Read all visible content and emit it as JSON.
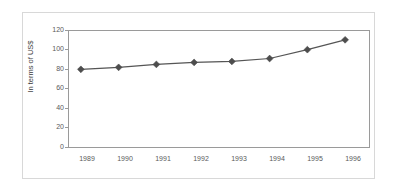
{
  "chart_data": {
    "type": "line",
    "title": "",
    "subtitle": "",
    "xlabel": "",
    "ylabel": "In terms of US$",
    "categories": [
      "1989",
      "1990",
      "1991",
      "1992",
      "1993",
      "1994",
      "1995",
      "1996"
    ],
    "values": [
      80,
      82,
      85,
      87,
      88,
      91,
      100,
      110
    ],
    "series": [
      {
        "name": "",
        "values": [
          80,
          82,
          85,
          87,
          88,
          91,
          100,
          110
        ]
      }
    ],
    "ylim": [
      0,
      120
    ],
    "yticks": [
      0,
      20,
      40,
      60,
      80,
      100,
      120
    ],
    "ytick_labels": [
      "0",
      "20",
      "40",
      "60",
      "80",
      "100",
      "120"
    ],
    "grid": false,
    "legend": "none",
    "marker": "diamond",
    "line_color": "#555555",
    "marker_color": "#4d4d4d",
    "axis_color": "#9a9a9a",
    "frame_color": "#d8d8d8",
    "background": "#ffffff",
    "text_color": "#5a5a5a"
  },
  "axes": {
    "y": {
      "label": "In terms of US$",
      "ticks": [
        {
          "value": 120,
          "label": "120"
        },
        {
          "value": 100,
          "label": "100"
        },
        {
          "value": 80,
          "label": "80"
        },
        {
          "value": 60,
          "label": "60"
        },
        {
          "value": 40,
          "label": "40"
        },
        {
          "value": 20,
          "label": "20"
        },
        {
          "value": 0,
          "label": "0"
        }
      ]
    },
    "x": {
      "label": "",
      "ticks": [
        {
          "label": "1989"
        },
        {
          "label": "1990"
        },
        {
          "label": "1991"
        },
        {
          "label": "1992"
        },
        {
          "label": "1993"
        },
        {
          "label": "1994"
        },
        {
          "label": "1995"
        },
        {
          "label": "1996"
        }
      ]
    }
  }
}
